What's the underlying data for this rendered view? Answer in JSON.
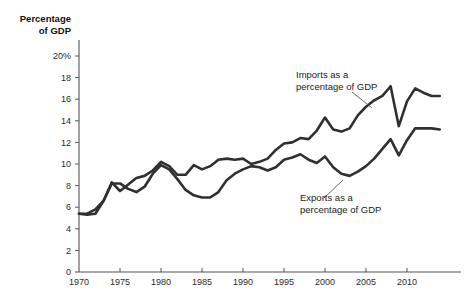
{
  "chart_data": {
    "type": "line",
    "title": "",
    "ylabel": "Percentage of GDP",
    "ylabel_line1": "Percentage",
    "ylabel_line2": "of GDP",
    "xlabel": "",
    "xlim": [
      1970,
      2014
    ],
    "ylim": [
      0,
      20
    ],
    "grid": false,
    "legend_position": "inline-annotations",
    "ytick_labels": [
      "20%",
      "18",
      "16",
      "14",
      "12",
      "10",
      "8",
      "6",
      "4",
      "2",
      "0"
    ],
    "ytick_values": [
      20,
      18,
      16,
      14,
      12,
      10,
      8,
      6,
      4,
      2,
      0
    ],
    "xtick_labels": [
      "1970",
      "1975",
      "1980",
      "1985",
      "1990",
      "1995",
      "2000",
      "2005",
      "2010"
    ],
    "xtick_values": [
      1970,
      1975,
      1980,
      1985,
      1990,
      1995,
      2000,
      2005,
      2010
    ],
    "x": [
      1970,
      1971,
      1972,
      1973,
      1974,
      1975,
      1976,
      1977,
      1978,
      1979,
      1980,
      1981,
      1982,
      1983,
      1984,
      1985,
      1986,
      1987,
      1988,
      1989,
      1990,
      1991,
      1992,
      1993,
      1994,
      1995,
      1996,
      1997,
      1998,
      1999,
      2000,
      2001,
      2002,
      2003,
      2004,
      2005,
      2006,
      2007,
      2008,
      2009,
      2010,
      2011,
      2012,
      2013,
      2014
    ],
    "series": [
      {
        "name": "Imports as a percentage of GDP",
        "label_line1": "Imports as a",
        "label_line2": "percentage of GDP",
        "color": "#303030",
        "values": [
          5.4,
          5.4,
          5.8,
          6.6,
          8.3,
          7.5,
          8.1,
          8.7,
          8.9,
          9.4,
          10.2,
          9.8,
          9.0,
          9.0,
          9.9,
          9.5,
          9.8,
          10.4,
          10.5,
          10.4,
          10.5,
          10.0,
          10.2,
          10.5,
          11.3,
          11.9,
          12.0,
          12.4,
          12.3,
          13.1,
          14.3,
          13.2,
          13.0,
          13.3,
          14.5,
          15.3,
          15.9,
          16.3,
          17.2,
          13.5,
          15.8,
          17.0,
          16.6,
          16.3,
          16.3
        ]
      },
      {
        "name": "Exports as a percentage of GDP",
        "label_line1": "Exports as a",
        "label_line2": "percentage of GDP",
        "color": "#303030",
        "values": [
          5.4,
          5.3,
          5.4,
          6.6,
          8.2,
          8.2,
          7.7,
          7.4,
          7.9,
          9.1,
          9.9,
          9.5,
          8.6,
          7.6,
          7.1,
          6.9,
          6.9,
          7.4,
          8.5,
          9.1,
          9.5,
          9.8,
          9.7,
          9.4,
          9.7,
          10.4,
          10.6,
          10.9,
          10.4,
          10.1,
          10.7,
          9.7,
          9.1,
          8.9,
          9.3,
          9.8,
          10.5,
          11.4,
          12.3,
          10.8,
          12.2,
          13.3,
          13.3,
          13.3,
          13.2
        ]
      }
    ],
    "annotations": [
      {
        "id": "imports-annotation",
        "line1": "Imports as a",
        "line2": "percentage of GDP",
        "text_x": 296,
        "text_y": 78,
        "leader": {
          "x1": 352,
          "y1": 92,
          "x2": 372,
          "y2": 108
        }
      },
      {
        "id": "exports-annotation",
        "line1": "Exports as a",
        "line2": "percentage of GDP",
        "text_x": 300,
        "text_y": 201,
        "leader": {
          "x1": 324,
          "y1": 198,
          "x2": 343,
          "y2": 180
        }
      }
    ]
  }
}
